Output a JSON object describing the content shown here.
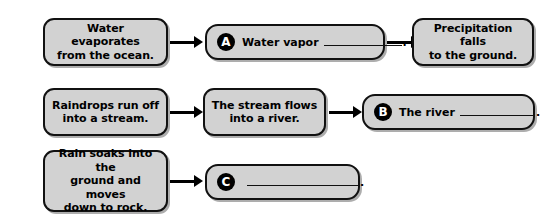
{
  "diagram": {
    "colors": {
      "box_fill": "#d2d2d2",
      "box_border": "#111111",
      "badge_fill": "#000000",
      "badge_text": "#ffffff",
      "arrow": "#000000",
      "page_background": "#ffffff"
    },
    "rows": [
      {
        "row_label": "row-1",
        "boxes": [
          {
            "kind": "statement",
            "name": "box-water-evaporates",
            "text": "Water evaporates\nfrom the ocean."
          },
          {
            "kind": "answer",
            "name": "answer-box-a",
            "badge": "A",
            "prefix": "Water vapor",
            "suffix": "."
          },
          {
            "kind": "statement",
            "name": "box-precipitation-falls",
            "text": "Precipitation falls\nto the ground."
          }
        ],
        "arrows": [
          "arrow-row1-1",
          "arrow-row1-2"
        ]
      },
      {
        "row_label": "row-2",
        "boxes": [
          {
            "kind": "statement",
            "name": "box-raindrops-run-off",
            "text": "Raindrops run off\ninto a stream."
          },
          {
            "kind": "statement",
            "name": "box-stream-flows",
            "text": "The stream flows\ninto a river."
          },
          {
            "kind": "answer",
            "name": "answer-box-b",
            "badge": "B",
            "prefix": "The river",
            "suffix": "."
          }
        ],
        "arrows": [
          "arrow-row2-1",
          "arrow-row2-2"
        ]
      },
      {
        "row_label": "row-3",
        "boxes": [
          {
            "kind": "statement",
            "name": "box-rain-soaks",
            "text": "Rain soaks into the\nground and moves\ndown to rock."
          },
          {
            "kind": "answer",
            "name": "answer-box-c",
            "badge": "C",
            "prefix": "",
            "suffix": "."
          }
        ],
        "arrows": [
          "arrow-row3-1"
        ]
      }
    ]
  }
}
